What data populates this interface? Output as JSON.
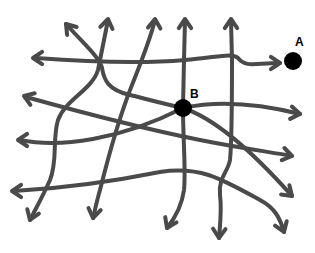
{
  "diagram": {
    "line_color": "#4a4a4a",
    "node_color": "#000000",
    "nodes": [
      {
        "id": "A",
        "label": "A"
      },
      {
        "id": "B",
        "label": "B"
      }
    ],
    "arrow_count": 18
  }
}
